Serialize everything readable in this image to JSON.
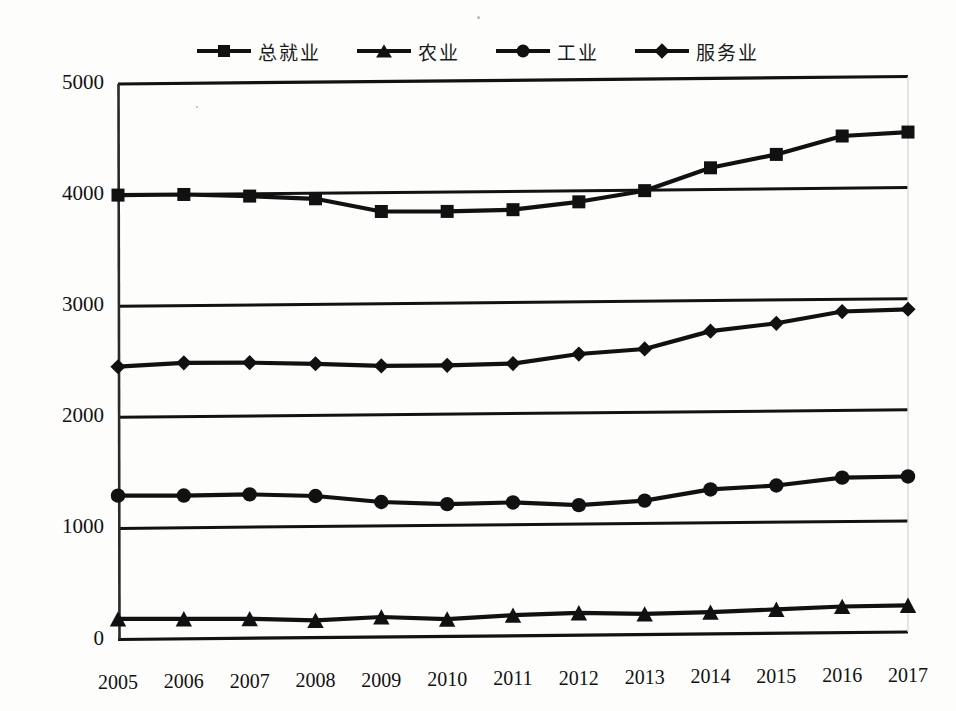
{
  "legend": {
    "position": "top-center",
    "items": [
      {
        "label": "总就业",
        "marker": "square-marker",
        "color": "#111111"
      },
      {
        "label": "农业",
        "marker": "triangle-marker",
        "color": "#111111"
      },
      {
        "label": "工业",
        "marker": "circle-marker",
        "color": "#111111"
      },
      {
        "label": "服务业",
        "marker": "diamond-marker",
        "color": "#111111"
      }
    ]
  },
  "axes": {
    "y_ticks": [
      "5000",
      "4000",
      "3000",
      "2000",
      "1000",
      "0"
    ],
    "x_ticks": [
      "2005",
      "2006",
      "2007",
      "2008",
      "2009",
      "2010",
      "2011",
      "2012",
      "2013",
      "2014",
      "2015",
      "2016",
      "2017"
    ]
  },
  "chart_data": {
    "type": "line",
    "title": "",
    "subtitle": "",
    "xlabel": "",
    "ylabel": "",
    "ylim": [
      0,
      5000
    ],
    "ytick_values": [
      0,
      1000,
      2000,
      3000,
      4000,
      5000
    ],
    "grid": true,
    "legend_position": "top-center",
    "x": [
      "2005",
      "2006",
      "2007",
      "2008",
      "2009",
      "2010",
      "2011",
      "2012",
      "2013",
      "2014",
      "2015",
      "2016",
      "2017"
    ],
    "categories": [
      "2005",
      "2006",
      "2007",
      "2008",
      "2009",
      "2010",
      "2011",
      "2012",
      "2013",
      "2014",
      "2015",
      "2016",
      "2017"
    ],
    "series": [
      {
        "name": "总就业",
        "marker": "square",
        "values": [
          4000,
          4000,
          3980,
          3950,
          3830,
          3825,
          3835,
          3900,
          3995,
          4195,
          4310,
          4470,
          4500
        ]
      },
      {
        "name": "农业",
        "marker": "triangle",
        "values": [
          185,
          180,
          175,
          155,
          180,
          155,
          185,
          200,
          185,
          195,
          215,
          235,
          240
        ]
      },
      {
        "name": "工业",
        "marker": "circle",
        "values": [
          1295,
          1290,
          1295,
          1275,
          1215,
          1190,
          1200,
          1170,
          1205,
          1300,
          1330,
          1395,
          1400
        ]
      },
      {
        "name": "服务业",
        "marker": "diamond",
        "values": [
          2455,
          2485,
          2480,
          2465,
          2440,
          2440,
          2450,
          2530,
          2570,
          2725,
          2790,
          2890,
          2905
        ]
      }
    ]
  }
}
